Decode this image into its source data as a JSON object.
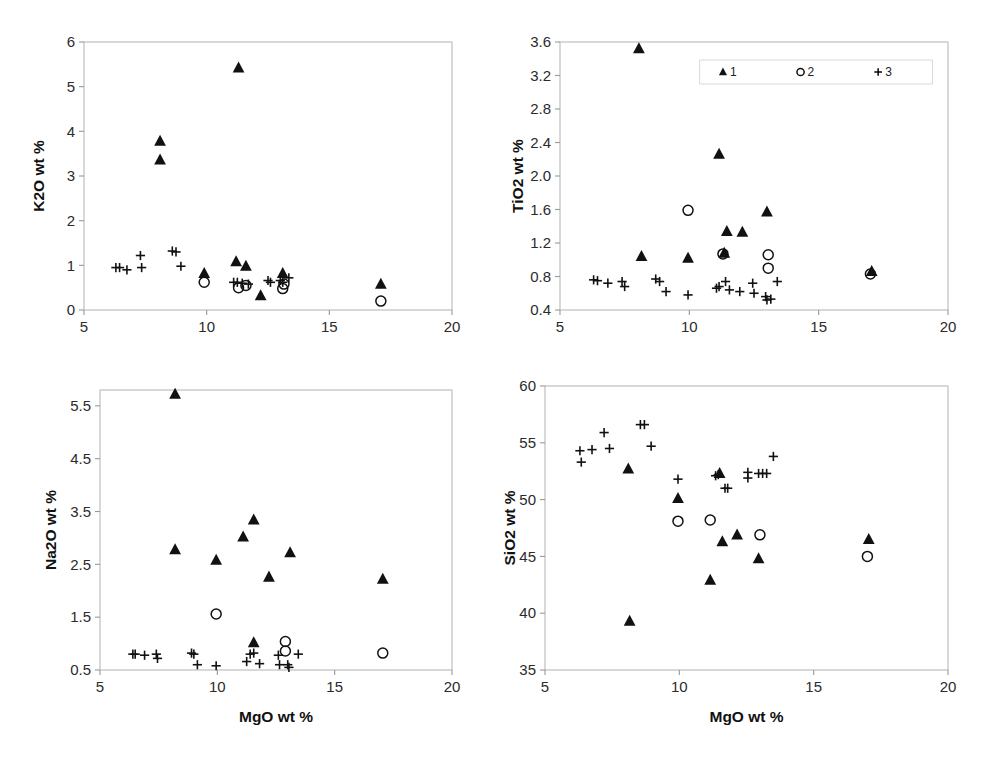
{
  "figure": {
    "title": "",
    "background_color": "#ffffff",
    "marker_color": "#111111",
    "axis_color": "#9a9a9a",
    "panel_count": 4
  },
  "legend": {
    "position": "top-right of TiO2 panel",
    "entries": [
      {
        "label": "1",
        "marker": "filled-triangle"
      },
      {
        "label": "2",
        "marker": "open-circle"
      },
      {
        "label": "3",
        "marker": "plus"
      }
    ]
  },
  "chart_data": [
    {
      "id": "k2o",
      "type": "scatter",
      "title": "",
      "xlabel": "",
      "ylabel": "K2O wt %",
      "xlim": [
        5,
        20
      ],
      "ylim": [
        0,
        6
      ],
      "xticks": [
        5,
        10,
        15,
        20
      ],
      "yticks": [
        0,
        1,
        2,
        3,
        4,
        5,
        6
      ],
      "xticklabels": [
        "5",
        "10",
        "15",
        "20"
      ],
      "yticklabels": [
        "0",
        "1",
        "2",
        "3",
        "4",
        "5",
        "6"
      ],
      "grid": false,
      "legend_visible": false,
      "series": [
        {
          "name": "1",
          "marker": "filled-triangle",
          "points": [
            [
              8.1,
              3.78
            ],
            [
              8.1,
              3.36
            ],
            [
              11.3,
              5.42
            ],
            [
              9.9,
              0.82
            ],
            [
              11.2,
              1.08
            ],
            [
              11.6,
              0.98
            ],
            [
              12.2,
              0.32
            ],
            [
              13.1,
              0.82
            ],
            [
              17.1,
              0.58
            ]
          ]
        },
        {
          "name": "2",
          "marker": "open-circle",
          "points": [
            [
              9.9,
              0.62
            ],
            [
              11.3,
              0.5
            ],
            [
              11.6,
              0.55
            ],
            [
              13.1,
              0.48
            ],
            [
              13.15,
              0.58
            ],
            [
              17.1,
              0.2
            ]
          ]
        },
        {
          "name": "3",
          "marker": "plus",
          "points": [
            [
              6.3,
              0.95
            ],
            [
              6.45,
              0.95
            ],
            [
              6.75,
              0.9
            ],
            [
              7.3,
              1.22
            ],
            [
              7.35,
              0.95
            ],
            [
              8.6,
              1.32
            ],
            [
              8.75,
              1.3
            ],
            [
              8.95,
              0.98
            ],
            [
              11.1,
              0.62
            ],
            [
              11.25,
              0.62
            ],
            [
              11.45,
              0.6
            ],
            [
              11.7,
              0.58
            ],
            [
              12.5,
              0.66
            ],
            [
              12.6,
              0.62
            ],
            [
              13.0,
              0.66
            ],
            [
              13.1,
              0.62
            ],
            [
              13.35,
              0.72
            ]
          ]
        }
      ]
    },
    {
      "id": "tio2",
      "type": "scatter",
      "title": "",
      "xlabel": "",
      "ylabel": "TiO2 wt %",
      "xlim": [
        5,
        20
      ],
      "ylim": [
        0.4,
        3.6
      ],
      "xticks": [
        5,
        10,
        15,
        20
      ],
      "yticks": [
        0.4,
        0.8,
        1.2,
        1.6,
        2.0,
        2.4,
        2.8,
        3.2,
        3.6
      ],
      "xticklabels": [
        "5",
        "10",
        "15",
        "20"
      ],
      "yticklabels": [
        "0.4",
        "0.8",
        "1.2",
        "1.6",
        "2.0",
        "2.4",
        "2.8",
        "3.2",
        "3.6"
      ],
      "grid": false,
      "legend_visible": true,
      "series": [
        {
          "name": "1",
          "marker": "filled-triangle",
          "points": [
            [
              8.05,
              3.52
            ],
            [
              8.15,
              1.04
            ],
            [
              9.95,
              1.02
            ],
            [
              11.15,
              2.26
            ],
            [
              11.45,
              1.34
            ],
            [
              12.05,
              1.33
            ],
            [
              11.35,
              1.08
            ],
            [
              13.0,
              1.57
            ],
            [
              17.05,
              0.86
            ]
          ]
        },
        {
          "name": "2",
          "marker": "open-circle",
          "points": [
            [
              9.95,
              1.59
            ],
            [
              11.3,
              1.07
            ],
            [
              13.05,
              1.06
            ],
            [
              13.05,
              0.9
            ],
            [
              17.0,
              0.83
            ]
          ]
        },
        {
          "name": "3",
          "marker": "plus",
          "points": [
            [
              6.3,
              0.76
            ],
            [
              6.45,
              0.75
            ],
            [
              6.85,
              0.72
            ],
            [
              7.4,
              0.74
            ],
            [
              7.5,
              0.68
            ],
            [
              8.7,
              0.77
            ],
            [
              8.85,
              0.74
            ],
            [
              9.1,
              0.62
            ],
            [
              9.95,
              0.58
            ],
            [
              11.05,
              0.66
            ],
            [
              11.15,
              0.68
            ],
            [
              11.4,
              0.74
            ],
            [
              11.55,
              0.64
            ],
            [
              11.95,
              0.62
            ],
            [
              12.45,
              0.72
            ],
            [
              12.5,
              0.6
            ],
            [
              12.95,
              0.56
            ],
            [
              13.0,
              0.52
            ],
            [
              13.15,
              0.53
            ],
            [
              13.4,
              0.74
            ]
          ]
        }
      ]
    },
    {
      "id": "na2o",
      "type": "scatter",
      "title": "",
      "xlabel": "MgO wt %",
      "ylabel": "Na2O wt %",
      "xlim": [
        5,
        20
      ],
      "ylim": [
        0.5,
        5.8
      ],
      "xticks": [
        5,
        10,
        15,
        20
      ],
      "yticks": [
        0.5,
        1.5,
        2.5,
        3.5,
        4.5,
        5.5
      ],
      "xticklabels": [
        "5",
        "10",
        "15",
        "20"
      ],
      "yticklabels": [
        "0.5",
        "1.5",
        "2.5",
        "3.5",
        "4.5",
        "5.5"
      ],
      "grid": false,
      "legend_visible": false,
      "series": [
        {
          "name": "1",
          "marker": "filled-triangle",
          "points": [
            [
              8.2,
              5.72
            ],
            [
              8.2,
              2.78
            ],
            [
              9.95,
              2.58
            ],
            [
              11.1,
              3.02
            ],
            [
              11.55,
              3.34
            ],
            [
              12.2,
              2.26
            ],
            [
              13.1,
              2.72
            ],
            [
              17.05,
              2.22
            ],
            [
              11.55,
              1.02
            ]
          ]
        },
        {
          "name": "2",
          "marker": "open-circle",
          "points": [
            [
              9.95,
              1.56
            ],
            [
              12.9,
              1.04
            ],
            [
              12.9,
              0.86
            ],
            [
              17.05,
              0.82
            ]
          ]
        },
        {
          "name": "3",
          "marker": "plus",
          "points": [
            [
              6.4,
              0.8
            ],
            [
              6.5,
              0.8
            ],
            [
              6.9,
              0.78
            ],
            [
              7.4,
              0.8
            ],
            [
              7.45,
              0.72
            ],
            [
              8.9,
              0.82
            ],
            [
              9.0,
              0.8
            ],
            [
              9.15,
              0.6
            ],
            [
              9.95,
              0.58
            ],
            [
              11.25,
              0.66
            ],
            [
              11.4,
              0.8
            ],
            [
              11.55,
              0.82
            ],
            [
              11.8,
              0.62
            ],
            [
              12.6,
              0.78
            ],
            [
              12.65,
              0.6
            ],
            [
              13.0,
              0.6
            ],
            [
              13.05,
              0.55
            ],
            [
              13.45,
              0.8
            ]
          ]
        }
      ]
    },
    {
      "id": "sio2",
      "type": "scatter",
      "title": "",
      "xlabel": "MgO wt %",
      "ylabel": "SiO2 wt %",
      "xlim": [
        5,
        20
      ],
      "ylim": [
        35,
        60
      ],
      "xticks": [
        5,
        10,
        15,
        20
      ],
      "yticks": [
        35,
        40,
        45,
        50,
        55,
        60
      ],
      "xticklabels": [
        "5",
        "10",
        "15",
        "20"
      ],
      "yticklabels": [
        "35",
        "40",
        "45",
        "50",
        "55",
        "60"
      ],
      "grid": false,
      "legend_visible": false,
      "series": [
        {
          "name": "1",
          "marker": "filled-triangle",
          "points": [
            [
              8.1,
              52.7
            ],
            [
              8.15,
              39.3
            ],
            [
              9.95,
              50.1
            ],
            [
              11.15,
              42.9
            ],
            [
              11.5,
              52.3
            ],
            [
              11.6,
              46.3
            ],
            [
              12.15,
              46.9
            ],
            [
              12.95,
              44.8
            ],
            [
              17.05,
              46.5
            ]
          ]
        },
        {
          "name": "2",
          "marker": "open-circle",
          "points": [
            [
              9.95,
              48.1
            ],
            [
              11.15,
              48.2
            ],
            [
              13.0,
              46.9
            ],
            [
              17.0,
              45.0
            ]
          ]
        },
        {
          "name": "3",
          "marker": "plus",
          "points": [
            [
              6.3,
              54.3
            ],
            [
              6.35,
              53.3
            ],
            [
              6.75,
              54.4
            ],
            [
              7.2,
              55.9
            ],
            [
              7.4,
              54.5
            ],
            [
              8.55,
              56.6
            ],
            [
              8.7,
              56.6
            ],
            [
              8.95,
              54.7
            ],
            [
              9.95,
              51.8
            ],
            [
              11.35,
              52.1
            ],
            [
              11.45,
              52.2
            ],
            [
              11.7,
              51.0
            ],
            [
              11.8,
              51.0
            ],
            [
              12.55,
              52.4
            ],
            [
              12.55,
              51.9
            ],
            [
              12.95,
              52.3
            ],
            [
              13.1,
              52.3
            ],
            [
              13.25,
              52.3
            ],
            [
              13.5,
              53.8
            ]
          ]
        }
      ]
    }
  ]
}
